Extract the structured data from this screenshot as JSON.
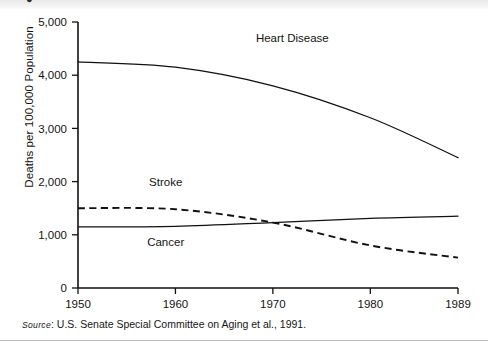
{
  "figure": {
    "marker": "●",
    "source_prefix": "Source",
    "source_text": ": U.S. Senate Special Committee on Aging et al., 1991."
  },
  "chart_data": {
    "type": "line",
    "title": "",
    "xlabel": "",
    "ylabel": "Deaths per 100,000 Population",
    "x": [
      1950,
      1960,
      1970,
      1980,
      1989
    ],
    "xtick_labels": [
      "1950",
      "1960",
      "1970",
      "1980",
      "1989"
    ],
    "ytick_labels": [
      "0",
      "1,000",
      "2,000",
      "3,000",
      "4,000",
      "5,000"
    ],
    "yticks": [
      0,
      1000,
      2000,
      3000,
      4000,
      5000
    ],
    "xlim": [
      1950,
      1989
    ],
    "ylim": [
      0,
      5000
    ],
    "grid": false,
    "legend": "inline-annotations",
    "series": [
      {
        "name": "Heart Disease",
        "style": "solid",
        "color": "#111111",
        "label_x": 1972,
        "label_y": 4620,
        "values": [
          4250,
          4150,
          3800,
          3200,
          2450
        ]
      },
      {
        "name": "Stroke",
        "style": "dashed",
        "color": "#111111",
        "label_x": 1959,
        "label_y": 1920,
        "values": [
          1500,
          1480,
          1230,
          800,
          570
        ]
      },
      {
        "name": "Cancer",
        "style": "solid",
        "color": "#111111",
        "label_x": 1959,
        "label_y": 790,
        "values": [
          1150,
          1160,
          1230,
          1310,
          1350
        ]
      }
    ]
  }
}
